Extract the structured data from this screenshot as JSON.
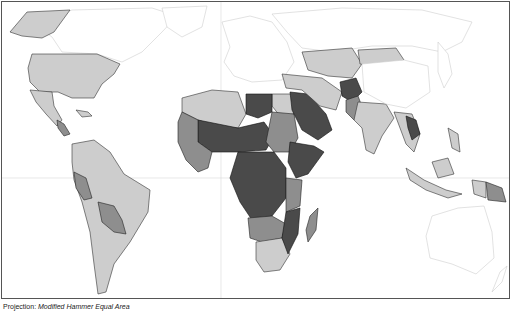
{
  "map": {
    "title": "",
    "projection_label": "Projection:",
    "projection_value": "Modified Hammer Equal Area",
    "type": "choropleth world map (grayscale)",
    "classes": [
      {
        "id": "none",
        "color": "#ffffff",
        "description": "no data / not shaded"
      },
      {
        "id": "low",
        "color": "#cdcdcd",
        "description": "light gray"
      },
      {
        "id": "mid",
        "color": "#8e8e8e",
        "description": "medium gray"
      },
      {
        "id": "high",
        "color": "#4a4a4a",
        "description": "dark gray"
      }
    ],
    "regions": [
      {
        "name": "Canada / Greenland / Russia / Europe / Australia",
        "class": "none"
      },
      {
        "name": "United States & Alaska",
        "class": "low"
      },
      {
        "name": "Mexico & Central America",
        "class": "low"
      },
      {
        "name": "South America",
        "class": "low"
      },
      {
        "name": "Bolivia / Paraguay / Peru",
        "class": "mid"
      },
      {
        "name": "North Africa (Algeria, Egypt)",
        "class": "low"
      },
      {
        "name": "Libya / Sahel / Central Africa",
        "class": "high"
      },
      {
        "name": "West & East Africa",
        "class": "mid"
      },
      {
        "name": "Southern Africa",
        "class": "low"
      },
      {
        "name": "Madagascar",
        "class": "mid"
      },
      {
        "name": "Arabian Peninsula (Saudi Arabia, Yemen)",
        "class": "high"
      },
      {
        "name": "Iran / Central Asia / Mongolia / China",
        "class": "low"
      },
      {
        "name": "Afghanistan",
        "class": "high"
      },
      {
        "name": "Pakistan",
        "class": "mid"
      },
      {
        "name": "India / South Asia",
        "class": "low"
      },
      {
        "name": "Laos",
        "class": "high"
      },
      {
        "name": "Southeast Asia & Indonesia",
        "class": "low"
      },
      {
        "name": "Papua New Guinea",
        "class": "mid"
      }
    ]
  }
}
